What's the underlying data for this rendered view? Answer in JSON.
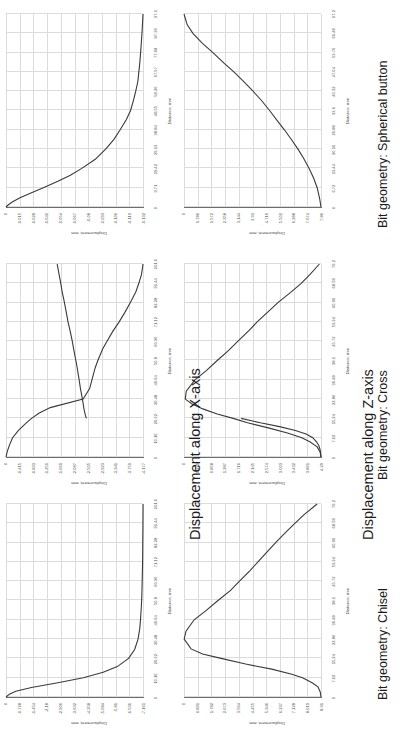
{
  "page": {
    "orientation": "rotated-90-ccw",
    "background_color": "#ffffff",
    "curve_color": "#3a3a3a",
    "grid_color": "#dcdcdc",
    "axis_color": "#6d6d6d"
  },
  "sections": [
    {
      "title": "Displacement along X-axis"
    },
    {
      "title": "Displacement along Z-axis"
    }
  ],
  "geometries": [
    {
      "label": "Bit geometry: Chisel"
    },
    {
      "label": "Bit geometry: Cross"
    },
    {
      "label": "Bit geometry: Spherical button"
    }
  ],
  "axis_titles": {
    "x": "Distance, mm",
    "y": "Displacement, mm"
  },
  "chart_data": [
    {
      "id": "x-chisel",
      "type": "line",
      "title": "Displacement along X-axis",
      "subtitle": "Bit geometry: Chisel",
      "xlabel": "Distance, mm",
      "ylabel": "Displacement, mm",
      "grid": true,
      "legend": "none",
      "xlim": [
        0,
        101.6
      ],
      "ylim": [
        -7.262,
        0
      ],
      "xticks": [
        "0",
        "10.16",
        "20.32",
        "30.48",
        "40.64",
        "50.8",
        "60.96",
        "71.12",
        "82.28",
        "91.44",
        "101.6"
      ],
      "yticks": [
        "0",
        "-0.728",
        "-1.454",
        "-2.18",
        "-2.906",
        "-3.632",
        "-4.358",
        "-5.084",
        "-5.81",
        "-6.536",
        "-7.161"
      ],
      "x": [
        0,
        1.5,
        3,
        5,
        7.5,
        10.16,
        13,
        16,
        20.32,
        25,
        30.48,
        36,
        40.64,
        47,
        50.8,
        57,
        60.96,
        66,
        71.12,
        76,
        82.28,
        87,
        91.44,
        96,
        101.6
      ],
      "y": [
        0,
        -0.18,
        -0.52,
        -1.35,
        -2.75,
        -4.1,
        -5.15,
        -5.9,
        -6.5,
        -6.82,
        -7.0,
        -7.09,
        -7.13,
        -7.17,
        -7.19,
        -7.21,
        -7.22,
        -7.23,
        -7.24,
        -7.245,
        -7.25,
        -7.255,
        -7.258,
        -7.26,
        -7.262
      ]
    },
    {
      "id": "x-cross",
      "type": "line",
      "title": "Displacement along X-axis",
      "subtitle": "Bit geometry: Cross",
      "xlabel": "Distance, mm",
      "ylabel": "Displacement, mm",
      "grid": true,
      "legend": "none",
      "xlim": [
        0,
        101.6
      ],
      "ylim": [
        -4.177,
        0
      ],
      "xticks": [
        "0",
        "10.16",
        "20.32",
        "30.48",
        "40.64",
        "50.8",
        "60.96",
        "71.12",
        "82.28",
        "91.44",
        "101.6"
      ],
      "yticks": [
        "0",
        "-0.415",
        "-0.833",
        "-1.251",
        "-1.669",
        "-2.087",
        "-2.505",
        "-2.923",
        "-3.341",
        "-3.759",
        "-4.177"
      ],
      "x": [
        0,
        3,
        6,
        10.16,
        14,
        18,
        20.32,
        23,
        26,
        30.48,
        36,
        40.64,
        47,
        50.8,
        57,
        60.96,
        66,
        71.12,
        76,
        82.28,
        87,
        91.44,
        96,
        101.6
      ],
      "y": [
        0,
        -0.04,
        -0.1,
        -0.2,
        -0.38,
        -0.62,
        -0.78,
        -1.0,
        -1.35,
        -2.35,
        -2.55,
        -2.62,
        -2.72,
        -2.8,
        -2.95,
        -3.08,
        -3.25,
        -3.45,
        -3.62,
        -3.82,
        -3.96,
        -4.05,
        -4.13,
        -4.177
      ],
      "branch_x": [
        20.32,
        22,
        25,
        30.48,
        36,
        40.64,
        47,
        50.8,
        57,
        60.96,
        66,
        71.12,
        76,
        82.28,
        87,
        91.44,
        96,
        101.6
      ],
      "branch_y": [
        -2.45,
        -2.42,
        -2.38,
        -2.33,
        -2.27,
        -2.23,
        -2.17,
        -2.13,
        -2.06,
        -2.02,
        -1.96,
        -1.89,
        -1.84,
        -1.77,
        -1.71,
        -1.67,
        -1.62,
        -1.56
      ]
    },
    {
      "id": "x-spherical",
      "type": "line",
      "title": "Displacement along X-axis",
      "subtitle": "Bit geometry: Spherical button",
      "xlabel": "Distance, mm",
      "ylabel": "Displacement, mm",
      "grid": true,
      "legend": "none",
      "xlim": [
        0,
        97.1
      ],
      "ylim": [
        -0.132,
        0
      ],
      "xticks": [
        "0",
        "9.71",
        "19.42",
        "29.13",
        "38.84",
        "48.55",
        "58.26",
        "67.97",
        "77.68",
        "87.39",
        "97.1"
      ],
      "yticks": [
        "0",
        "-0.015",
        "-0.028",
        "-0.041",
        "-0.054",
        "-0.067",
        "-0.08",
        "-0.093",
        "-0.106",
        "-0.119",
        "-0.132"
      ],
      "x": [
        0,
        1,
        2.5,
        4.5,
        7,
        9.71,
        13,
        16,
        19.42,
        24,
        29.13,
        34,
        38.84,
        44,
        48.55,
        54,
        58.26,
        63,
        67.97,
        73,
        77.68,
        82,
        87.39,
        92,
        97.1
      ],
      "y": [
        0,
        -0.002,
        -0.006,
        -0.013,
        -0.024,
        -0.036,
        -0.05,
        -0.062,
        -0.073,
        -0.086,
        -0.096,
        -0.104,
        -0.11,
        -0.116,
        -0.12,
        -0.123,
        -0.125,
        -0.127,
        -0.128,
        -0.129,
        -0.1297,
        -0.1303,
        -0.131,
        -0.1315,
        -0.132
      ]
    },
    {
      "id": "z-chisel",
      "type": "line",
      "title": "Displacement along Z-axis",
      "subtitle": "Bit geometry: Chisel",
      "xlabel": "Distance, mm",
      "ylabel": "Displacement, mm",
      "grid": true,
      "legend": "none",
      "xlim": [
        0,
        76.2
      ],
      "ylim": [
        0,
        8.91
      ],
      "xticks": [
        "0",
        "7.62",
        "15.24",
        "22.86",
        "30.48",
        "38.1",
        "45.72",
        "53.34",
        "60.96",
        "68.58",
        "76.2"
      ],
      "yticks": [
        "0",
        "0.891",
        "1.782",
        "2.673",
        "3.564",
        "4.455",
        "5.346",
        "6.237",
        "7.128",
        "8.019",
        "8.91"
      ],
      "x": [
        0,
        2,
        4,
        5.5,
        7.62,
        9,
        11,
        13,
        15.24,
        17,
        19,
        22.86,
        26,
        30.48,
        34,
        38.1,
        42,
        45.72,
        50,
        53.34,
        58,
        60.96,
        65,
        68.58,
        72,
        76.2
      ],
      "y": [
        0,
        0.05,
        0.2,
        0.55,
        1.2,
        1.9,
        3.2,
        4.9,
        6.5,
        7.7,
        8.45,
        8.9,
        8.78,
        8.25,
        7.5,
        6.7,
        5.9,
        5.3,
        4.6,
        4.1,
        3.4,
        2.95,
        2.3,
        1.7,
        1.1,
        0.25
      ],
      "branch_x": [
        0,
        1.5,
        3,
        4.5,
        6,
        7.62,
        9,
        11,
        13,
        15.24
      ],
      "branch_y": [
        0,
        0.02,
        0.06,
        0.12,
        0.22,
        0.4,
        0.62,
        1.05,
        1.6,
        2.1
      ]
    },
    {
      "id": "z-cross",
      "type": "line",
      "title": "Displacement along Z-axis",
      "subtitle": "Bit geometry: Cross",
      "xlabel": "Distance, mm",
      "ylabel": "Displacement, mm",
      "grid": true,
      "legend": "none",
      "xlim": [
        0,
        76.2
      ],
      "ylim": [
        0,
        4.29
      ],
      "xticks": [
        "0",
        "7.62",
        "15.24",
        "22.86",
        "30.48",
        "38.1",
        "45.72",
        "53.34",
        "60.96",
        "68.58",
        "76.2"
      ],
      "yticks": [
        "0",
        "0.429",
        "0.858",
        "1.287",
        "1.716",
        "2.145",
        "2.574",
        "3.003",
        "3.432",
        "3.861",
        "4.29"
      ],
      "x": [
        0,
        2,
        4,
        6,
        7.62,
        9.5,
        11.5,
        13.5,
        15.24,
        17,
        19,
        21,
        22.86,
        26,
        30.48,
        34,
        38.1,
        42,
        45.72,
        50,
        53.34,
        58,
        60.96,
        65,
        68.58,
        72,
        76.2
      ],
      "y": [
        0,
        0.03,
        0.12,
        0.35,
        0.6,
        1.05,
        1.65,
        2.3,
        2.75,
        3.25,
        3.7,
        4.05,
        4.25,
        4.22,
        3.95,
        3.6,
        3.25,
        2.9,
        2.6,
        2.25,
        2.0,
        1.6,
        1.35,
        0.95,
        0.62,
        0.35,
        0.05
      ],
      "branch_x": [
        0,
        1.5,
        3,
        4.5,
        6,
        7.62,
        9,
        10.5,
        12,
        13.5,
        15.24
      ],
      "branch_y": [
        0,
        0.01,
        0.03,
        0.07,
        0.14,
        0.26,
        0.45,
        0.8,
        1.3,
        1.9,
        2.5
      ]
    },
    {
      "id": "z-spherical",
      "type": "line",
      "title": "Displacement along Z-axis",
      "subtitle": "Bit geometry: Spherical button",
      "xlabel": "Distance, mm",
      "ylabel": "Displacement, mm",
      "grid": true,
      "legend": "none",
      "xlim": [
        0,
        67.2
      ],
      "ylim": [
        0,
        7.86
      ],
      "xticks": [
        "0",
        "6.72",
        "13.44",
        "20.16",
        "26.88",
        "33.6",
        "40.32",
        "47.04",
        "53.76",
        "60.48",
        "67.2"
      ],
      "yticks": [
        "0",
        "0.786",
        "1.572",
        "2.358",
        "3.144",
        "3.93",
        "4.716",
        "5.502",
        "6.288",
        "7.074",
        "7.86"
      ],
      "x": [
        0,
        3,
        6.72,
        10,
        13.44,
        17,
        20.16,
        23.5,
        26.88,
        30,
        33.6,
        37,
        40.32,
        43.5,
        47.04,
        50,
        53.76,
        57,
        60.48,
        63.5,
        67.2
      ],
      "y": [
        0,
        0.08,
        0.22,
        0.42,
        0.68,
        1.0,
        1.32,
        1.7,
        2.1,
        2.5,
        2.95,
        3.4,
        3.9,
        4.4,
        5.0,
        5.55,
        6.2,
        6.8,
        7.35,
        7.68,
        7.86
      ]
    }
  ]
}
